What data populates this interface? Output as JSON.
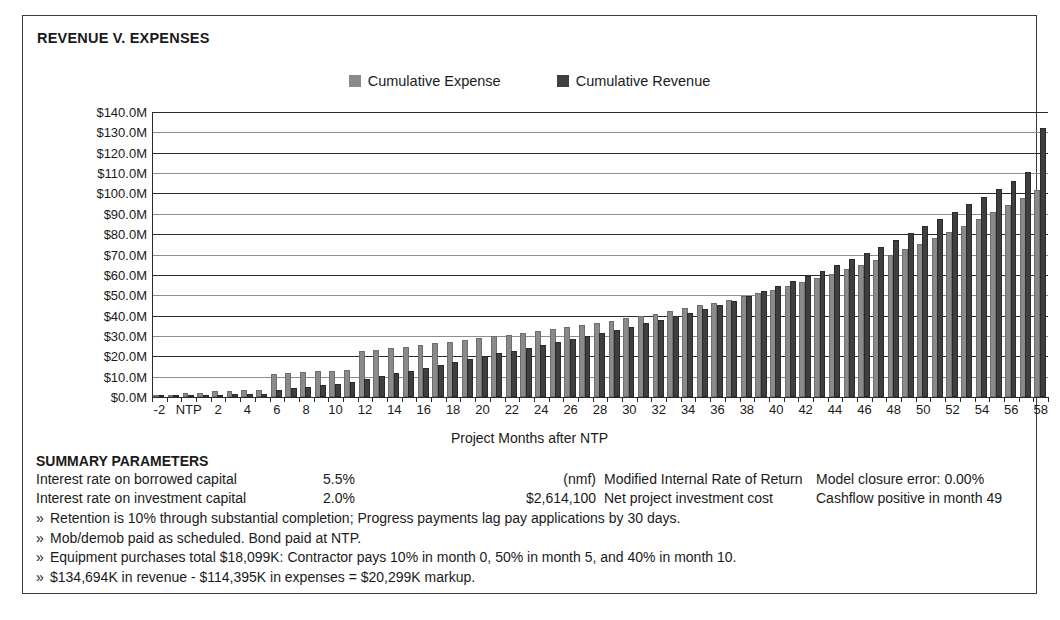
{
  "chart_title": "REVENUE V. EXPENSES",
  "legend": [
    {
      "label": "Cumulative Expense",
      "color": "#8a8a8a",
      "key": "expense"
    },
    {
      "label": "Cumulative Revenue",
      "color": "#3f3f3f",
      "key": "revenue"
    }
  ],
  "xtitle": "Project Months after NTP",
  "summary": {
    "heading": "SUMMARY PARAMETERS",
    "rows": [
      {
        "label": "Interest rate on borrowed capital",
        "value1": "5.5%",
        "value2": "(nmf)",
        "desc": "Modified Internal Rate of Return",
        "right": "Model closure error: 0.00%"
      },
      {
        "label": "Interest rate on investment capital",
        "value1": "2.0%",
        "value2": "$2,614,100",
        "desc": "Net project investment cost",
        "right": "Cashflow positive in month 49"
      }
    ],
    "notes": [
      "Retention is 10% through substantial completion; Progress payments lag pay applications by 30 days.",
      "Mob/demob paid as scheduled.  Bond paid at NTP.",
      "Equipment purchases total $18,099K: Contractor pays 10% in month 0, 50% in month 5, and 40% in month 10.",
      "$134,694K in revenue - $114,395K in expenses = $20,299K markup."
    ],
    "bullet_glyph": "»"
  },
  "chart_data": {
    "type": "bar",
    "title": "REVENUE V. EXPENSES",
    "xlabel": "Project Months after NTP",
    "ylabel": "",
    "ylim": [
      0,
      140
    ],
    "y_unit": "$M",
    "grid": true,
    "legend_position": "top-center",
    "y_ticks": [
      0,
      10,
      20,
      30,
      40,
      50,
      60,
      70,
      80,
      90,
      100,
      110,
      120,
      130,
      140
    ],
    "y_tick_labels": [
      "$0.0M",
      "$10.0M",
      "$20.0M",
      "$30.0M",
      "$40.0M",
      "$50.0M",
      "$60.0M",
      "$70.0M",
      "$80.0M",
      "$90.0M",
      "$100.0M",
      "$110.0M",
      "$120.0M",
      "$130.0M",
      "$140.0M"
    ],
    "categories": [
      -2,
      -1,
      0,
      1,
      2,
      3,
      4,
      5,
      6,
      7,
      8,
      9,
      10,
      11,
      12,
      13,
      14,
      15,
      16,
      17,
      18,
      19,
      20,
      21,
      22,
      23,
      24,
      25,
      26,
      27,
      28,
      29,
      30,
      31,
      32,
      33,
      34,
      35,
      36,
      37,
      38,
      39,
      40,
      41,
      42,
      43,
      44,
      45,
      46,
      47,
      48,
      49,
      50,
      51,
      52,
      53,
      54,
      55,
      56,
      57,
      58
    ],
    "x_tick_labels": [
      {
        "cat": -2,
        "label": "-2"
      },
      {
        "cat": 0,
        "label": "NTP"
      },
      {
        "cat": 2,
        "label": "2"
      },
      {
        "cat": 4,
        "label": "4"
      },
      {
        "cat": 6,
        "label": "6"
      },
      {
        "cat": 8,
        "label": "8"
      },
      {
        "cat": 10,
        "label": "10"
      },
      {
        "cat": 12,
        "label": "12"
      },
      {
        "cat": 14,
        "label": "14"
      },
      {
        "cat": 16,
        "label": "16"
      },
      {
        "cat": 18,
        "label": "18"
      },
      {
        "cat": 20,
        "label": "20"
      },
      {
        "cat": 22,
        "label": "22"
      },
      {
        "cat": 24,
        "label": "24"
      },
      {
        "cat": 26,
        "label": "26"
      },
      {
        "cat": 28,
        "label": "28"
      },
      {
        "cat": 30,
        "label": "30"
      },
      {
        "cat": 32,
        "label": "32"
      },
      {
        "cat": 34,
        "label": "34"
      },
      {
        "cat": 36,
        "label": "36"
      },
      {
        "cat": 38,
        "label": "38"
      },
      {
        "cat": 40,
        "label": "40"
      },
      {
        "cat": 42,
        "label": "42"
      },
      {
        "cat": 44,
        "label": "44"
      },
      {
        "cat": 46,
        "label": "46"
      },
      {
        "cat": 48,
        "label": "48"
      },
      {
        "cat": 50,
        "label": "50"
      },
      {
        "cat": 52,
        "label": "52"
      },
      {
        "cat": 54,
        "label": "54"
      },
      {
        "cat": 56,
        "label": "56"
      },
      {
        "cat": 58,
        "label": "58"
      }
    ],
    "series": [
      {
        "name": "Cumulative Expense",
        "color": "#8a8a8a",
        "values": [
          0.4,
          0.6,
          2.1,
          2.2,
          3.0,
          3.1,
          3.4,
          3.6,
          11.4,
          11.8,
          12.2,
          12.6,
          13.0,
          13.4,
          22.6,
          23.2,
          24.0,
          24.8,
          25.6,
          26.4,
          27.2,
          28.0,
          28.9,
          29.8,
          30.7,
          31.6,
          32.5,
          33.4,
          34.4,
          35.4,
          36.4,
          37.5,
          38.6,
          39.8,
          41.0,
          42.3,
          43.6,
          45.0,
          46.4,
          47.9,
          49.4,
          51.0,
          52.7,
          54.5,
          56.4,
          58.4,
          60.5,
          62.7,
          65.0,
          67.4,
          69.9,
          72.5,
          75.2,
          78.0,
          81.0,
          84.1,
          87.4,
          90.8,
          94.3,
          97.9,
          101.5
        ]
      },
      {
        "name": "Cumulative Revenue",
        "color": "#3f3f3f",
        "values": [
          0.0,
          0.0,
          0.8,
          0.9,
          1.2,
          1.3,
          1.5,
          1.7,
          3.4,
          4.2,
          5.0,
          5.8,
          6.6,
          7.6,
          8.8,
          10.2,
          11.6,
          13.0,
          14.4,
          15.8,
          17.2,
          18.6,
          20.0,
          21.4,
          22.8,
          24.2,
          25.6,
          27.0,
          28.5,
          30.0,
          31.5,
          33.0,
          34.6,
          36.2,
          37.9,
          39.6,
          41.4,
          43.3,
          45.3,
          47.4,
          49.6,
          51.9,
          54.3,
          56.8,
          59.4,
          62.1,
          64.9,
          67.8,
          70.8,
          73.9,
          77.1,
          80.4,
          83.8,
          87.3,
          90.9,
          94.6,
          98.4,
          102.3,
          106.3,
          110.4,
          132.0
        ]
      }
    ]
  }
}
